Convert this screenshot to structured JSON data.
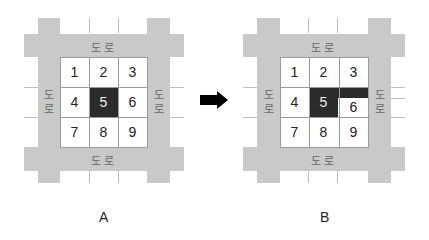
{
  "road_label": "도로",
  "road_label_chars": [
    "도",
    "로"
  ],
  "colors": {
    "road": "#c9c9c9",
    "occupied": "#2b2b2b",
    "cell": "#ffffff"
  },
  "panels": [
    {
      "caption": "A",
      "cells": [
        "1",
        "2",
        "3",
        "4",
        "5",
        "6",
        "7",
        "8",
        "9"
      ],
      "occupied_cells": [
        "5"
      ],
      "extension": null
    },
    {
      "caption": "B",
      "cells": [
        "1",
        "2",
        "3",
        "4",
        "5",
        "6",
        "7",
        "8",
        "9"
      ],
      "occupied_cells": [
        "5"
      ],
      "extension": "upper part of cell 6 attached to cell 5"
    }
  ],
  "arrow": {
    "icon": "right-arrow-icon",
    "direction": "right"
  }
}
